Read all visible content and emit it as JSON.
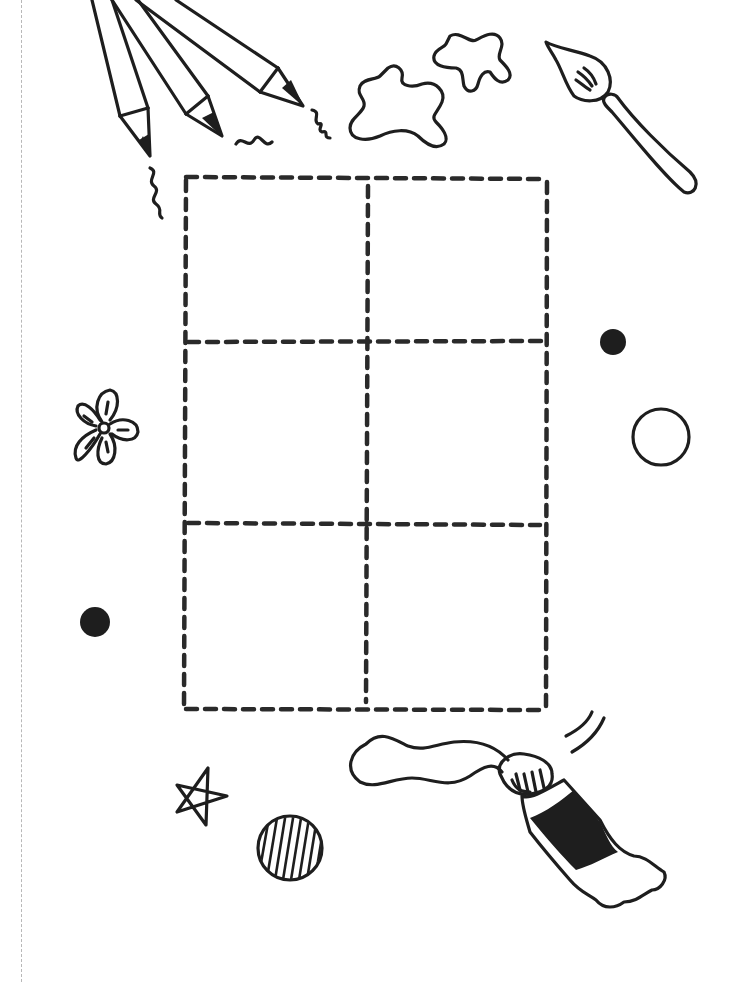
{
  "page": {
    "title": "Art supplies comic-panel template",
    "background": "#ffffff",
    "ink_color": "#1e1e1e"
  },
  "cut_line": {
    "style": "dashed",
    "color": "#b8b8b8",
    "x": 21
  },
  "grid": {
    "rows": 3,
    "columns": 2,
    "panels": [
      {
        "row": 1,
        "col": 1
      },
      {
        "row": 1,
        "col": 2
      },
      {
        "row": 2,
        "col": 1
      },
      {
        "row": 2,
        "col": 2
      },
      {
        "row": 3,
        "col": 1
      },
      {
        "row": 3,
        "col": 2
      }
    ],
    "bounds": {
      "left": 186,
      "top": 177,
      "right": 546,
      "bottom": 710
    },
    "line_style": "dashed"
  },
  "decorations": [
    {
      "name": "pencils",
      "count": 3,
      "position": "top-left"
    },
    {
      "name": "squiggles",
      "count": 3
    },
    {
      "name": "paint-splats",
      "count": 2,
      "position": "top-center"
    },
    {
      "name": "paintbrush",
      "position": "top-right"
    },
    {
      "name": "flower",
      "position": "left-middle"
    },
    {
      "name": "filled-dots",
      "count": 2
    },
    {
      "name": "hollow-circle",
      "position": "right-middle"
    },
    {
      "name": "star",
      "position": "bottom-left"
    },
    {
      "name": "striped-ball",
      "position": "bottom-left"
    },
    {
      "name": "paint-tube",
      "position": "bottom-right"
    }
  ]
}
